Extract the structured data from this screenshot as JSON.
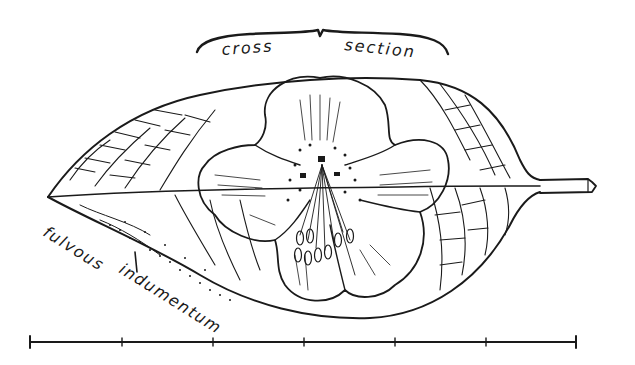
{
  "illustration": {
    "subject": "leaf with flower",
    "annotations": {
      "cross_section": "cross section",
      "fulvous_indumentum": "fulvous indumentum"
    },
    "scale_bar": {
      "ticks": 7
    },
    "colors": {
      "ink": "#1a1a1a",
      "paper": "#ffffff"
    }
  }
}
